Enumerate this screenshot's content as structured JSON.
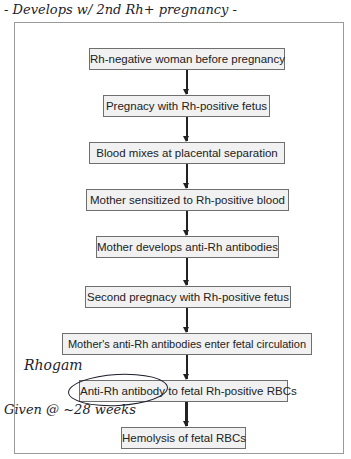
{
  "annotations": {
    "top_note": "- Develops w/ 2nd Rh+ pregnancy -",
    "rhogam_label": "Rhogam",
    "given_note": "Given @ ~28 weeks"
  },
  "flowchart": {
    "steps": [
      {
        "label": "Rh-negative woman before pregnancy"
      },
      {
        "label": "Pregnacy with Rh-positive fetus"
      },
      {
        "label": "Blood mixes at placental separation"
      },
      {
        "label": "Mother sensitized to Rh-positive blood"
      },
      {
        "label": "Mother develops anti-Rh antibodies"
      },
      {
        "label": "Second pregnacy with Rh-positive fetus"
      },
      {
        "label": "Mother's anti-Rh antibodies enter fetal circulation"
      },
      {
        "label": "Anti-Rh antibody to fetal Rh-positive RBCs"
      },
      {
        "label": "Hemolysis of fetal RBCs"
      }
    ]
  }
}
